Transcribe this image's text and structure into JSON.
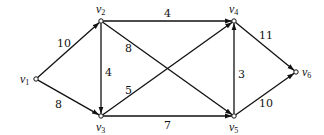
{
  "diagram": {
    "type": "directed-weighted-graph",
    "nodes": [
      {
        "id": "v1",
        "label": "v",
        "sub": "1",
        "x": 36,
        "y": 79,
        "lx": 20,
        "ly": 83
      },
      {
        "id": "v2",
        "label": "v",
        "sub": "2",
        "x": 101,
        "y": 21,
        "lx": 96,
        "ly": 13
      },
      {
        "id": "v3",
        "label": "v",
        "sub": "3",
        "x": 101,
        "y": 116,
        "lx": 96,
        "ly": 131
      },
      {
        "id": "v4",
        "label": "v",
        "sub": "4",
        "x": 234,
        "y": 21,
        "lx": 229,
        "ly": 13
      },
      {
        "id": "v5",
        "label": "v",
        "sub": "5",
        "x": 234,
        "y": 116,
        "lx": 229,
        "ly": 131
      },
      {
        "id": "v6",
        "label": "v",
        "sub": "6",
        "x": 296,
        "y": 72,
        "lx": 302,
        "ly": 76
      }
    ],
    "edges": [
      {
        "from": "v1",
        "to": "v2",
        "weight": "10",
        "lx": 57,
        "ly": 47
      },
      {
        "from": "v1",
        "to": "v3",
        "weight": "8",
        "lx": 55,
        "ly": 108
      },
      {
        "from": "v2",
        "to": "v3",
        "weight": "4",
        "lx": 105,
        "ly": 76
      },
      {
        "from": "v2",
        "to": "v4",
        "weight": "4",
        "lx": 164,
        "ly": 17
      },
      {
        "from": "v2",
        "to": "v5",
        "weight": "8",
        "lx": 125,
        "ly": 52
      },
      {
        "from": "v3",
        "to": "v4",
        "weight": "5",
        "lx": 125,
        "ly": 94
      },
      {
        "from": "v3",
        "to": "v5",
        "weight": "7",
        "lx": 164,
        "ly": 129
      },
      {
        "from": "v5",
        "to": "v4",
        "weight": "3",
        "lx": 238,
        "ly": 78
      },
      {
        "from": "v4",
        "to": "v6",
        "weight": "11",
        "lx": 259,
        "ly": 39
      },
      {
        "from": "v5",
        "to": "v6",
        "weight": "10",
        "lx": 259,
        "ly": 107
      }
    ]
  }
}
